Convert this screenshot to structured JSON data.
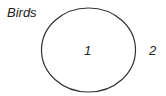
{
  "diagram": {
    "type": "venn",
    "sets": [
      {
        "name": "Birds",
        "label": "Birds"
      }
    ],
    "regions": [
      {
        "id": "inside-birds",
        "label": "1"
      },
      {
        "id": "outside",
        "label": "2"
      }
    ],
    "colors": {
      "stroke": "#333333",
      "text": "#222222",
      "background": "#ffffff"
    }
  }
}
